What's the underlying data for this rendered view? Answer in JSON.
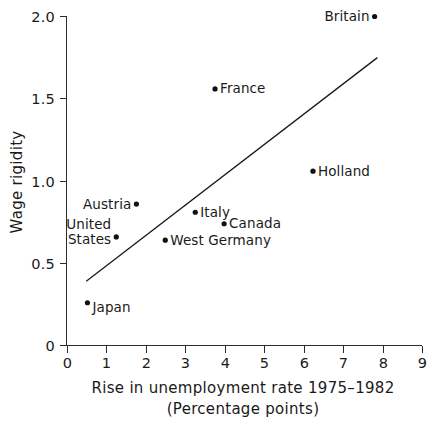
{
  "chart_data": {
    "type": "scatter",
    "title": "",
    "xlabel": "Rise in unemployment rate 1975–1982",
    "xlabel_line2": "(Percentage points)",
    "ylabel": "Wage rigidity",
    "xlim": [
      0,
      9
    ],
    "ylim": [
      0,
      2.0
    ],
    "xticks": [
      "0",
      "1",
      "2",
      "3",
      "4",
      "5",
      "6",
      "7",
      "8",
      "9"
    ],
    "xtick_values": [
      0,
      1,
      2,
      3,
      4,
      5,
      6,
      7,
      8,
      9
    ],
    "yticks": [
      "0",
      "0.5",
      "1.0",
      "1.5",
      "2.0"
    ],
    "ytick_values": [
      0,
      0.5,
      1.0,
      1.5,
      2.0
    ],
    "grid": false,
    "legend": "none",
    "marker_color": "#111111",
    "line_color": "#1a1a1a",
    "points": [
      {
        "label": "Britain",
        "x": 7.8,
        "y": 2.0,
        "label_side": "left"
      },
      {
        "label": "France",
        "x": 3.76,
        "y": 1.56,
        "label_side": "right"
      },
      {
        "label": "Holland",
        "x": 6.24,
        "y": 1.06,
        "label_side": "right"
      },
      {
        "label": "Austria",
        "x": 1.77,
        "y": 0.86,
        "label_side": "left"
      },
      {
        "label": "Italy",
        "x": 3.26,
        "y": 0.81,
        "label_side": "right"
      },
      {
        "label": "Canada",
        "x": 3.99,
        "y": 0.74,
        "label_side": "right"
      },
      {
        "label": "United States",
        "x": 1.26,
        "y": 0.66,
        "label_side": "left"
      },
      {
        "label": "West Germany",
        "x": 2.5,
        "y": 0.64,
        "label_side": "right"
      },
      {
        "label": "Japan",
        "x": 0.53,
        "y": 0.26,
        "label_side": "right"
      }
    ],
    "fit_line": {
      "x0": 0.5,
      "y0": 0.39,
      "x1": 7.87,
      "y1": 1.75
    }
  }
}
